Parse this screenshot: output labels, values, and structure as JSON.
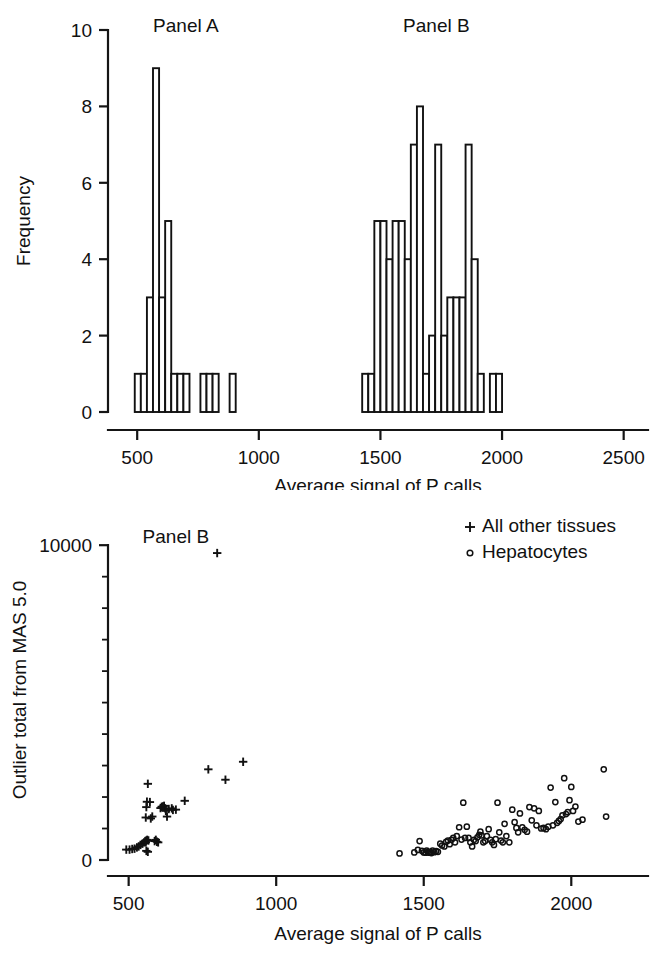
{
  "figure": {
    "title": "",
    "panels": [
      "histogram",
      "scatter"
    ]
  },
  "chart_data": [
    {
      "type": "bar",
      "id": "histogram",
      "title": "",
      "subtitle": "",
      "xlabel": "Average signal of P calls",
      "ylabel": "Frequency",
      "xlim": [
        380,
        2600
      ],
      "ylim": [
        0,
        10
      ],
      "xticks": [
        500,
        1000,
        1500,
        2000,
        2500
      ],
      "xticklabels": [
        "500",
        "1000",
        "1500",
        "2000",
        "2500"
      ],
      "yticks": [
        0,
        2,
        4,
        6,
        8,
        10
      ],
      "yticklabels": [
        "0",
        "2",
        "4",
        "6",
        "8",
        "10"
      ],
      "grid": false,
      "legend_position": "none",
      "annotations": [
        {
          "text": "Panel A",
          "x": 700,
          "y": 10.1
        },
        {
          "text": "Panel B",
          "x": 1730,
          "y": 10.1
        }
      ],
      "bin_width": 25,
      "bins": [
        {
          "x0": 490,
          "x1": 515,
          "count": 1
        },
        {
          "x0": 515,
          "x1": 540,
          "count": 1
        },
        {
          "x0": 540,
          "x1": 565,
          "count": 3
        },
        {
          "x0": 565,
          "x1": 590,
          "count": 9
        },
        {
          "x0": 590,
          "x1": 615,
          "count": 3
        },
        {
          "x0": 615,
          "x1": 640,
          "count": 5
        },
        {
          "x0": 640,
          "x1": 665,
          "count": 1
        },
        {
          "x0": 665,
          "x1": 690,
          "count": 1
        },
        {
          "x0": 690,
          "x1": 715,
          "count": 1
        },
        {
          "x0": 760,
          "x1": 785,
          "count": 1
        },
        {
          "x0": 785,
          "x1": 810,
          "count": 1
        },
        {
          "x0": 810,
          "x1": 835,
          "count": 1
        },
        {
          "x0": 880,
          "x1": 905,
          "count": 1
        },
        {
          "x0": 1425,
          "x1": 1450,
          "count": 1
        },
        {
          "x0": 1450,
          "x1": 1475,
          "count": 1
        },
        {
          "x0": 1475,
          "x1": 1500,
          "count": 5
        },
        {
          "x0": 1500,
          "x1": 1525,
          "count": 5
        },
        {
          "x0": 1525,
          "x1": 1550,
          "count": 4
        },
        {
          "x0": 1550,
          "x1": 1575,
          "count": 5
        },
        {
          "x0": 1575,
          "x1": 1600,
          "count": 5
        },
        {
          "x0": 1600,
          "x1": 1625,
          "count": 4
        },
        {
          "x0": 1625,
          "x1": 1650,
          "count": 7
        },
        {
          "x0": 1650,
          "x1": 1675,
          "count": 8
        },
        {
          "x0": 1675,
          "x1": 1700,
          "count": 1
        },
        {
          "x0": 1700,
          "x1": 1725,
          "count": 2
        },
        {
          "x0": 1725,
          "x1": 1750,
          "count": 7
        },
        {
          "x0": 1750,
          "x1": 1775,
          "count": 2
        },
        {
          "x0": 1775,
          "x1": 1800,
          "count": 3
        },
        {
          "x0": 1800,
          "x1": 1825,
          "count": 3
        },
        {
          "x0": 1825,
          "x1": 1850,
          "count": 3
        },
        {
          "x0": 1850,
          "x1": 1875,
          "count": 7
        },
        {
          "x0": 1875,
          "x1": 1900,
          "count": 4
        },
        {
          "x0": 1900,
          "x1": 1925,
          "count": 1
        },
        {
          "x0": 1950,
          "x1": 1975,
          "count": 1
        },
        {
          "x0": 1975,
          "x1": 2000,
          "count": 1
        }
      ]
    },
    {
      "type": "scatter",
      "id": "scatter",
      "title": "",
      "xlabel": "Average signal of P calls",
      "ylabel": "Outlier total from MAS 5.0",
      "xlim": [
        430,
        2260
      ],
      "ylim": [
        0,
        10800
      ],
      "xticks": [
        500,
        1000,
        1500,
        2000
      ],
      "xticklabels": [
        "500",
        "1000",
        "1500",
        "2000"
      ],
      "yticks": [
        0,
        10000
      ],
      "yticklabels": [
        "0",
        "10000"
      ],
      "yminorticks": [
        1000,
        2000,
        3000,
        4000,
        5000,
        6000,
        7000,
        8000,
        9000
      ],
      "grid": false,
      "legend_position": "top-right",
      "annotations": [
        {
          "text": "Panel B",
          "x": 660,
          "y": 10250
        }
      ],
      "legend": [
        {
          "label": "All other tissues",
          "marker": "plus"
        },
        {
          "label": "Hepatocytes",
          "marker": "circle"
        }
      ],
      "series": [
        {
          "name": "All other tissues",
          "marker": "plus",
          "points": [
            [
              492,
              330
            ],
            [
              503,
              330
            ],
            [
              512,
              350
            ],
            [
              520,
              360
            ],
            [
              528,
              400
            ],
            [
              534,
              430
            ],
            [
              540,
              480
            ],
            [
              547,
              520
            ],
            [
              552,
              560
            ],
            [
              556,
              600
            ],
            [
              558,
              560
            ],
            [
              560,
              620
            ],
            [
              563,
              640
            ],
            [
              560,
              290
            ],
            [
              565,
              260
            ],
            [
              567,
              620
            ],
            [
              558,
              1350
            ],
            [
              560,
              1680
            ],
            [
              562,
              1850
            ],
            [
              565,
              2420
            ],
            [
              572,
              1840
            ],
            [
              575,
              1320
            ],
            [
              580,
              1380
            ],
            [
              588,
              600
            ],
            [
              592,
              640
            ],
            [
              596,
              580
            ],
            [
              600,
              560
            ],
            [
              608,
              1650
            ],
            [
              612,
              1690
            ],
            [
              616,
              1700
            ],
            [
              620,
              1720
            ],
            [
              624,
              1640
            ],
            [
              626,
              1560
            ],
            [
              630,
              1380
            ],
            [
              636,
              1620
            ],
            [
              646,
              1640
            ],
            [
              650,
              1590
            ],
            [
              660,
              1600
            ],
            [
              690,
              1880
            ],
            [
              770,
              2880
            ],
            [
              800,
              9750
            ],
            [
              828,
              2550
            ],
            [
              888,
              3120
            ]
          ]
        },
        {
          "name": "Hepatocytes",
          "marker": "circle",
          "points": [
            [
              1418,
              210
            ],
            [
              1468,
              240
            ],
            [
              1480,
              320
            ],
            [
              1486,
              600
            ],
            [
              1494,
              290
            ],
            [
              1500,
              240
            ],
            [
              1506,
              230
            ],
            [
              1510,
              300
            ],
            [
              1514,
              260
            ],
            [
              1518,
              230
            ],
            [
              1522,
              250
            ],
            [
              1526,
              220
            ],
            [
              1530,
              300
            ],
            [
              1536,
              250
            ],
            [
              1542,
              280
            ],
            [
              1548,
              260
            ],
            [
              1556,
              520
            ],
            [
              1562,
              460
            ],
            [
              1570,
              430
            ],
            [
              1576,
              580
            ],
            [
              1582,
              620
            ],
            [
              1588,
              500
            ],
            [
              1594,
              640
            ],
            [
              1600,
              700
            ],
            [
              1606,
              560
            ],
            [
              1612,
              760
            ],
            [
              1620,
              1040
            ],
            [
              1628,
              650
            ],
            [
              1634,
              1820
            ],
            [
              1640,
              700
            ],
            [
              1646,
              1060
            ],
            [
              1652,
              700
            ],
            [
              1658,
              560
            ],
            [
              1664,
              430
            ],
            [
              1670,
              640
            ],
            [
              1676,
              600
            ],
            [
              1682,
              720
            ],
            [
              1688,
              800
            ],
            [
              1692,
              900
            ],
            [
              1696,
              780
            ],
            [
              1702,
              560
            ],
            [
              1708,
              600
            ],
            [
              1714,
              760
            ],
            [
              1720,
              980
            ],
            [
              1726,
              640
            ],
            [
              1732,
              560
            ],
            [
              1738,
              480
            ],
            [
              1744,
              660
            ],
            [
              1750,
              1820
            ],
            [
              1756,
              880
            ],
            [
              1762,
              620
            ],
            [
              1768,
              560
            ],
            [
              1774,
              1150
            ],
            [
              1780,
              760
            ],
            [
              1790,
              560
            ],
            [
              1800,
              1600
            ],
            [
              1808,
              1200
            ],
            [
              1814,
              1020
            ],
            [
              1820,
              880
            ],
            [
              1826,
              1480
            ],
            [
              1834,
              1040
            ],
            [
              1842,
              960
            ],
            [
              1850,
              900
            ],
            [
              1858,
              1680
            ],
            [
              1866,
              1260
            ],
            [
              1874,
              1640
            ],
            [
              1882,
              1100
            ],
            [
              1890,
              1560
            ],
            [
              1898,
              1000
            ],
            [
              1906,
              1020
            ],
            [
              1914,
              980
            ],
            [
              1922,
              1060
            ],
            [
              1930,
              2300
            ],
            [
              1938,
              1100
            ],
            [
              1946,
              1840
            ],
            [
              1952,
              1180
            ],
            [
              1958,
              1240
            ],
            [
              1964,
              1300
            ],
            [
              1970,
              1420
            ],
            [
              1976,
              2600
            ],
            [
              1982,
              1460
            ],
            [
              1988,
              1520
            ],
            [
              1994,
              1900
            ],
            [
              2000,
              2320
            ],
            [
              2006,
              1560
            ],
            [
              2014,
              1700
            ],
            [
              2024,
              1220
            ],
            [
              2038,
              1280
            ],
            [
              2110,
              2880
            ],
            [
              2118,
              1380
            ]
          ]
        }
      ]
    }
  ],
  "axes": {
    "histogram": {
      "xlabel": "Average signal of P calls",
      "ylabel": "Frequency"
    },
    "scatter": {
      "xlabel": "Average signal of P calls",
      "ylabel": "Outlier total from MAS 5.0"
    }
  },
  "colors": {
    "ink": "#111111",
    "background": "#ffffff"
  }
}
